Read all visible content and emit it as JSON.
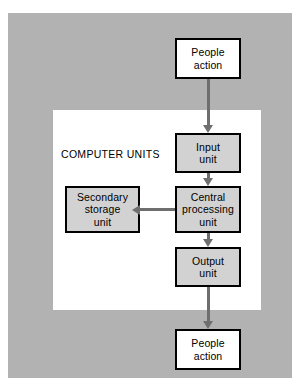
{
  "diagram": {
    "background_color": "#ffffff",
    "panel_color": "#b2b2b2",
    "inner_panel_color": "#ffffff",
    "node_fill_gray": "#d2d2d2",
    "node_fill_white": "#ffffff",
    "border_color": "#000000",
    "arrow_color": "#6e6e6e",
    "group_label": "COMPUTER UNITS",
    "nodes": [
      {
        "id": "people-action-top",
        "lines": [
          "People",
          "action"
        ],
        "fill": "white"
      },
      {
        "id": "input-unit",
        "lines": [
          "Input",
          "unit"
        ],
        "fill": "gray"
      },
      {
        "id": "secondary-storage-unit",
        "lines": [
          "Secondary",
          "storage",
          "unit"
        ],
        "fill": "gray"
      },
      {
        "id": "central-processing-unit",
        "lines": [
          "Central",
          "processing",
          "unit"
        ],
        "fill": "gray"
      },
      {
        "id": "output-unit",
        "lines": [
          "Output",
          "unit"
        ],
        "fill": "gray"
      },
      {
        "id": "people-action-bottom",
        "lines": [
          "People",
          "action"
        ],
        "fill": "white"
      }
    ],
    "connectors": [
      {
        "id": "people-top-to-input",
        "from": "people-action-top",
        "to": "input-unit",
        "direction": "down",
        "heads": 1
      },
      {
        "id": "input-to-cpu",
        "from": "input-unit",
        "to": "central-processing-unit",
        "direction": "down",
        "heads": 1
      },
      {
        "id": "secondary-to-cpu",
        "from": "secondary-storage-unit",
        "to": "central-processing-unit",
        "direction": "horizontal",
        "heads": 2
      },
      {
        "id": "cpu-to-output",
        "from": "central-processing-unit",
        "to": "output-unit",
        "direction": "down",
        "heads": 1
      },
      {
        "id": "output-to-people-bottom",
        "from": "output-unit",
        "to": "people-action-bottom",
        "direction": "down",
        "heads": 1
      }
    ]
  }
}
